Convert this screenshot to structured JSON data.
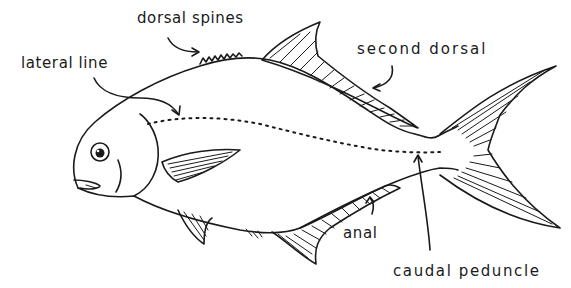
{
  "diagram": {
    "colors": {
      "ink": "#1a1a1a",
      "background": "#ffffff"
    },
    "labels": [
      {
        "id": "dorsal-spines",
        "text": "dorsal spines"
      },
      {
        "id": "lateral-line",
        "text": "lateral line"
      },
      {
        "id": "second-dorsal",
        "text": "second dorsal"
      },
      {
        "id": "anal",
        "text": "anal"
      },
      {
        "id": "caudal-peduncle",
        "text": "caudal peduncle"
      }
    ]
  }
}
